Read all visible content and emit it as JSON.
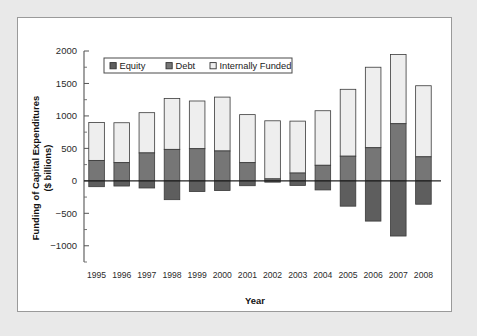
{
  "chart_data": {
    "type": "bar",
    "subtype": "stacked-bar-with-negative",
    "title": "",
    "xlabel": "Year",
    "ylabel": "Funding of Capital Expenditures ($ billions)",
    "ylim": [
      -1250,
      2000
    ],
    "ytick_labels": [
      "2000",
      "1500",
      "1000",
      "500",
      "0",
      "-500",
      "-1000"
    ],
    "ytick_values": [
      2000,
      1500,
      1000,
      500,
      0,
      -500,
      -1000
    ],
    "minor_ticks": true,
    "grid": false,
    "legend_position": "top-left-inside",
    "categories": [
      "1995",
      "1996",
      "1997",
      "1998",
      "1999",
      "2000",
      "2001",
      "2002",
      "2003",
      "2004",
      "2005",
      "2006",
      "2007",
      "2008"
    ],
    "series": [
      {
        "name": "Equity",
        "color": "#5e5e5e",
        "values": [
          -90,
          -80,
          -110,
          -290,
          -165,
          -150,
          -75,
          -20,
          -70,
          -140,
          -390,
          -620,
          -850,
          -360
        ]
      },
      {
        "name": "Debt",
        "color": "#767676",
        "values": [
          315,
          280,
          430,
          485,
          495,
          460,
          280,
          30,
          120,
          240,
          380,
          510,
          880,
          370
        ]
      },
      {
        "name": "Internally Funded",
        "color": "#eeeeee",
        "values": [
          585,
          615,
          620,
          785,
          735,
          830,
          740,
          895,
          800,
          840,
          1030,
          1240,
          1065,
          1095
        ]
      }
    ],
    "bar_totals_positive": [
      900,
      895,
      1050,
      1270,
      1230,
      1290,
      1020,
      925,
      920,
      1080,
      1410,
      1750,
      1945,
      1465
    ]
  },
  "legend": {
    "entries": [
      {
        "label": "Equity",
        "swatch": "dark-gray"
      },
      {
        "label": "Debt",
        "swatch": "medium-gray"
      },
      {
        "label": "Internally Funded",
        "swatch": "white"
      }
    ]
  },
  "colors": {
    "equity": "#5e5e5e",
    "debt": "#767676",
    "internally_funded": "#eeeeee",
    "page_background": "#e9e9e9",
    "figure_background": "#ffffff",
    "axis": "#555555"
  }
}
